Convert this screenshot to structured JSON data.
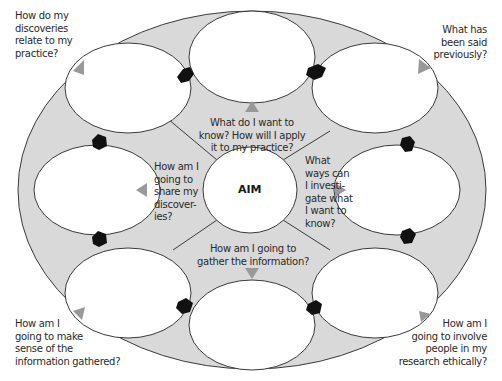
{
  "diagram": {
    "center_label": "AIM",
    "colors": {
      "fill_shaded": "#d9d9d9",
      "fill_circle": "#ffffff",
      "stroke": "#3a3a3a",
      "arrow_black": "#111111",
      "arrow_grey": "#999999"
    },
    "inner_questions": {
      "top": [
        "What do I want to",
        "know? How will I apply",
        "it to my practice?"
      ],
      "right": [
        "What",
        "ways can",
        "I investi-",
        "gate what",
        "I want to",
        "know?"
      ],
      "bottom": [
        "How  am I going to",
        "gather the information?"
      ],
      "left": [
        "How am I",
        "going to",
        "share my",
        "discover-",
        "ies?"
      ]
    },
    "corner_questions": {
      "top_left": [
        "How do my",
        "discoveries",
        "relate to my",
        "practice?"
      ],
      "top_right": [
        "What has",
        "been said",
        "previously?"
      ],
      "bottom_left": [
        "How am I",
        "going to make",
        "sense of the",
        "information gathered?"
      ],
      "bottom_right": [
        "How am I",
        "going to involve",
        "people in my",
        "research ethically?"
      ]
    }
  }
}
